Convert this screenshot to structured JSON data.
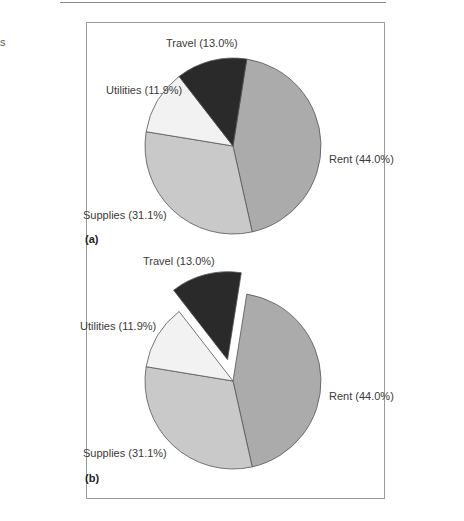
{
  "page": {
    "side_text": "s",
    "panel_a_label": "(a)",
    "panel_b_label": "(b)"
  },
  "chart_data": [
    {
      "type": "pie",
      "panel": "(a)",
      "title": "",
      "categories": [
        "Rent",
        "Supplies",
        "Utilities",
        "Travel"
      ],
      "values": [
        44.0,
        31.1,
        11.9,
        13.0
      ],
      "labels": [
        "Rent (44.0%)",
        "Supplies (31.1%)",
        "Utilities (11.9%)",
        "Travel (13.0%)"
      ],
      "colors": [
        "#ababab",
        "#c9c9c9",
        "#f2f2f2",
        "#2a2a2a"
      ],
      "exploded": []
    },
    {
      "type": "pie",
      "panel": "(b)",
      "title": "",
      "categories": [
        "Rent",
        "Supplies",
        "Utilities",
        "Travel"
      ],
      "values": [
        44.0,
        31.1,
        11.9,
        13.0
      ],
      "labels": [
        "Rent (44.0%)",
        "Supplies (31.1%)",
        "Utilities (11.9%)",
        "Travel (13.0%)"
      ],
      "colors": [
        "#ababab",
        "#c9c9c9",
        "#f2f2f2",
        "#2a2a2a"
      ],
      "exploded": [
        "Travel"
      ]
    }
  ]
}
